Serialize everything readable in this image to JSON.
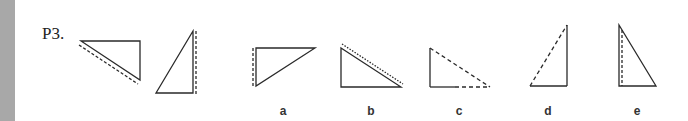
{
  "problem": {
    "label": "P3.",
    "line_color": "#2a2a2a",
    "given_figures": [
      {
        "id": "given-1",
        "points": [
          [
            81,
            41
          ],
          [
            140,
            41
          ],
          [
            140,
            80
          ]
        ],
        "extra": {
          "type": "dashed",
          "from": [
            79,
            45
          ],
          "to": [
            138,
            84
          ]
        }
      },
      {
        "id": "given-2",
        "points": [
          [
            193,
            31
          ],
          [
            156,
            93
          ],
          [
            193,
            93
          ]
        ],
        "extra": {
          "type": "dashed",
          "from": [
            196,
            31
          ],
          "to": [
            196,
            93
          ]
        }
      }
    ],
    "options": [
      {
        "label": "a",
        "x": 273
      },
      {
        "label": "b",
        "x": 361
      },
      {
        "label": "c",
        "x": 449
      },
      {
        "label": "d",
        "x": 538
      },
      {
        "label": "e",
        "x": 627
      }
    ]
  }
}
